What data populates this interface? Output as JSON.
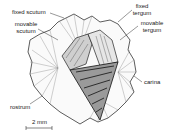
{
  "labels": {
    "fixed_scutum": "fixed scutum",
    "movable_scutum_1": "movable",
    "movable_scutum_2": "scutum",
    "fixed_tergum_1": "fixed",
    "fixed_tergum_2": "tergum",
    "movable_tergum_1": "movable",
    "movable_tergum_2": "tergum",
    "carina": "carina",
    "rostrum": "rostrum"
  },
  "scale_bar": {
    "label": "2 mm"
  }
}
